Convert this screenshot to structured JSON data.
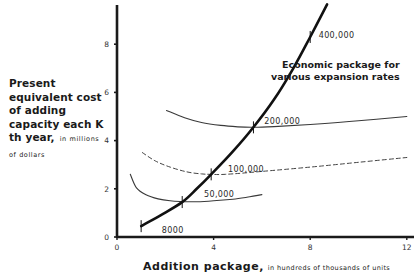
{
  "chart_data": {
    "type": "line",
    "title": "",
    "xlabel": "Addition package, in hundreds of thousands of units",
    "xlabel_main": "Addition package,",
    "xlabel_unit": "in hundreds of thousands of units",
    "ylabel": "Present equivalent cost of adding capacity each K th year, in millions of dollars",
    "ylabel_main": "Present equivalent cost of adding capacity each K th year,",
    "ylabel_unit": "in millions of dollars",
    "xlim": [
      0,
      12.2
    ],
    "ylim": [
      0,
      9.7
    ],
    "x_ticks": [
      0,
      4,
      8,
      12
    ],
    "x_tick_labels": [
      "0",
      "4",
      "8",
      "12"
    ],
    "y_ticks": [
      0,
      2,
      4,
      6,
      8
    ],
    "y_tick_labels": [
      "0",
      "2",
      "4",
      "6",
      "8"
    ],
    "grid": false,
    "annotation": "Economic package for various expansion rates",
    "annotation_lines": [
      "Economic package for",
      "various expansion rates"
    ],
    "series": [
      {
        "name": "50,000",
        "style": "solid",
        "x": [
          0.55,
          0.8,
          1.2,
          1.7,
          2.2,
          2.7,
          3.3,
          4.0,
          4.8,
          5.5,
          6.0
        ],
        "y": [
          2.6,
          2.05,
          1.75,
          1.58,
          1.5,
          1.47,
          1.46,
          1.5,
          1.57,
          1.67,
          1.76
        ]
      },
      {
        "name": "100,000",
        "style": "dashed",
        "x": [
          1.05,
          1.6,
          2.2,
          2.9,
          3.5,
          3.9,
          4.5,
          6.0,
          8.0,
          10.0,
          12.0
        ],
        "y": [
          3.5,
          3.15,
          2.9,
          2.7,
          2.62,
          2.6,
          2.6,
          2.72,
          2.9,
          3.1,
          3.3
        ]
      },
      {
        "name": "200,000",
        "style": "solid",
        "x": [
          2.05,
          2.8,
          3.5,
          4.3,
          5.0,
          5.65,
          6.5,
          8.0,
          10.0,
          12.0
        ],
        "y": [
          5.25,
          4.95,
          4.75,
          4.63,
          4.57,
          4.55,
          4.58,
          4.67,
          4.82,
          5.0
        ]
      },
      {
        "name": "Economic package",
        "style": "bold",
        "x": [
          1.0,
          1.8,
          2.7,
          3.3,
          3.9,
          4.8,
          5.65,
          6.5,
          7.3,
          8.0,
          8.7
        ],
        "y": [
          0.45,
          0.9,
          1.45,
          2.0,
          2.6,
          3.55,
          4.55,
          5.7,
          7.0,
          8.3,
          9.65
        ]
      }
    ],
    "economic_points": [
      {
        "label": "8000",
        "x": 1.0,
        "y": 0.45
      },
      {
        "label": "50,000",
        "x": 2.7,
        "y": 1.45
      },
      {
        "label": "100,000",
        "x": 3.9,
        "y": 2.6
      },
      {
        "label": "200,000",
        "x": 5.65,
        "y": 4.55
      },
      {
        "label": "400,000",
        "x": 8.0,
        "y": 8.3
      }
    ],
    "curve_labels": [
      {
        "text": "8000",
        "x": 1.85,
        "y": 0.28
      },
      {
        "text": "50,000",
        "x": 3.6,
        "y": 1.77
      },
      {
        "text": "100,000",
        "x": 4.6,
        "y": 2.82
      },
      {
        "text": "200,000",
        "x": 6.1,
        "y": 4.82
      },
      {
        "text": "400,000",
        "x": 8.35,
        "y": 8.4
      }
    ]
  }
}
